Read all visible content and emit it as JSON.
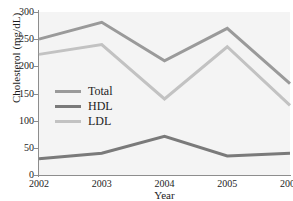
{
  "top_caption": "",
  "chart_data": {
    "type": "line",
    "title": "",
    "xlabel": "Year",
    "ylabel": "Cholesterol (mg/dL)",
    "x": [
      2002,
      2003,
      2004,
      2005,
      2006
    ],
    "xtick_labels": [
      "2002",
      "2003",
      "2004",
      "2005",
      "2006"
    ],
    "ytick_labels": [
      "0",
      "50",
      "100",
      "150",
      "200",
      "250",
      "300"
    ],
    "yticks": [
      0,
      50,
      100,
      150,
      200,
      250,
      300
    ],
    "ylim": [
      0,
      300
    ],
    "xlim": [
      2002,
      2006
    ],
    "grid": false,
    "legend_position": "center-left",
    "series": [
      {
        "name": "Total",
        "color": "#9a9a9a",
        "values": [
          250,
          281,
          210,
          270,
          168
        ]
      },
      {
        "name": "HDL",
        "color": "#7a7a7a",
        "values": [
          30,
          40,
          71,
          35,
          40
        ]
      },
      {
        "name": "LDL",
        "color": "#c2c2c2",
        "values": [
          222,
          240,
          140,
          236,
          128
        ]
      }
    ]
  },
  "style": {
    "plot_background": "#f4f4f4",
    "axis_color": "#8d8d8d",
    "text_color": "#1d1d1d"
  }
}
